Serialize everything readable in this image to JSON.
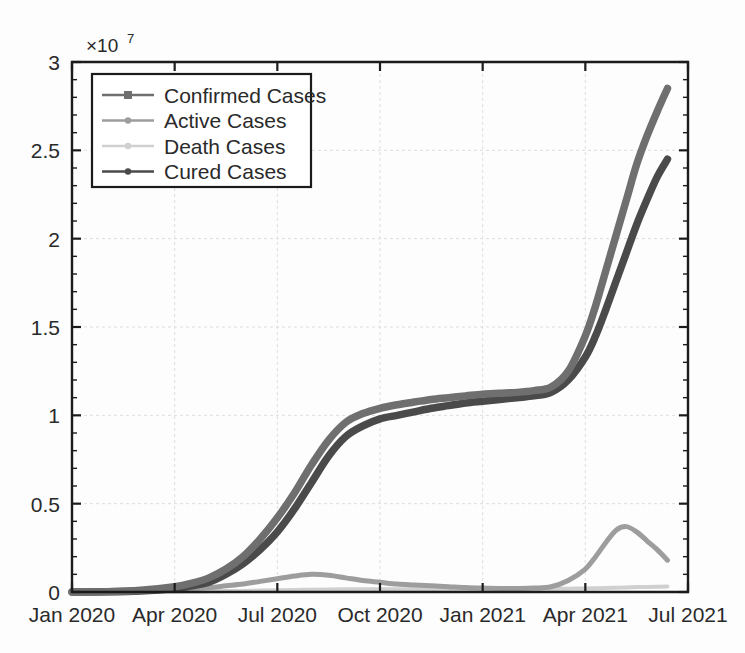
{
  "chart_data": {
    "type": "line",
    "title": "",
    "subtitle": "",
    "xlabel": "",
    "ylabel": "",
    "y_multiplier_label": "×10",
    "y_multiplier_exponent": "7",
    "y_multiplier_value": 10000000.0,
    "grid": true,
    "legend_position": "upper-left-inside",
    "xlim_labels": [
      "Jan 2020",
      "Jul 2021"
    ],
    "ylim": [
      0,
      3
    ],
    "yticks": [
      "0",
      "0.5",
      "1",
      "1.5",
      "2",
      "2.5",
      "3"
    ],
    "ytick_values": [
      0,
      0.5,
      1,
      1.5,
      2,
      2.5,
      3
    ],
    "xticks": [
      "Jan 2020",
      "Apr 2020",
      "Jul 2020",
      "Oct 2020",
      "Jan 2021",
      "Apr 2021",
      "Jul 2021"
    ],
    "xtick_values": [
      0,
      3,
      6,
      9,
      12,
      15,
      18
    ],
    "x_unit": "months since Jan 2020",
    "x": [
      0,
      1,
      2,
      3,
      3.5,
      4,
      4.5,
      5,
      5.5,
      6,
      6.5,
      7,
      7.5,
      8,
      8.5,
      9,
      9.5,
      10,
      10.5,
      11,
      11.5,
      12,
      12.5,
      13,
      13.5,
      14,
      14.5,
      15,
      15.3,
      15.6,
      15.9,
      16.2,
      16.5,
      16.8,
      17.1,
      17.4
    ],
    "series": [
      {
        "name": "Confirmed Cases",
        "color": "#6f6f6f",
        "marker": "square",
        "values": [
          0.0,
          0.002,
          0.01,
          0.03,
          0.05,
          0.08,
          0.13,
          0.2,
          0.3,
          0.42,
          0.56,
          0.72,
          0.86,
          0.96,
          1.01,
          1.04,
          1.06,
          1.075,
          1.09,
          1.1,
          1.11,
          1.12,
          1.125,
          1.13,
          1.14,
          1.16,
          1.25,
          1.45,
          1.62,
          1.82,
          2.02,
          2.22,
          2.42,
          2.58,
          2.72,
          2.85
        ]
      },
      {
        "name": "Active Cases",
        "color": "#9d9d9d",
        "marker": "dot",
        "values": [
          0.0,
          0.001,
          0.005,
          0.012,
          0.018,
          0.025,
          0.035,
          0.045,
          0.06,
          0.075,
          0.09,
          0.1,
          0.095,
          0.08,
          0.065,
          0.055,
          0.045,
          0.04,
          0.035,
          0.03,
          0.025,
          0.022,
          0.02,
          0.02,
          0.022,
          0.03,
          0.065,
          0.13,
          0.2,
          0.28,
          0.35,
          0.37,
          0.34,
          0.29,
          0.24,
          0.18
        ]
      },
      {
        "name": "Death Cases",
        "color": "#d0d0d0",
        "marker": "dot",
        "values": [
          0.0,
          0.0,
          0.001,
          0.002,
          0.003,
          0.004,
          0.005,
          0.006,
          0.008,
          0.01,
          0.012,
          0.013,
          0.014,
          0.015,
          0.015,
          0.016,
          0.016,
          0.016,
          0.017,
          0.017,
          0.017,
          0.017,
          0.017,
          0.018,
          0.018,
          0.018,
          0.019,
          0.02,
          0.021,
          0.022,
          0.024,
          0.026,
          0.028,
          0.029,
          0.03,
          0.031
        ]
      },
      {
        "name": "Cured Cases",
        "color": "#4a4a4a",
        "marker": "dot",
        "values": [
          0.0,
          0.001,
          0.006,
          0.02,
          0.035,
          0.055,
          0.1,
          0.16,
          0.24,
          0.34,
          0.47,
          0.62,
          0.77,
          0.88,
          0.94,
          0.98,
          1.0,
          1.02,
          1.04,
          1.055,
          1.07,
          1.08,
          1.09,
          1.1,
          1.11,
          1.13,
          1.2,
          1.33,
          1.45,
          1.6,
          1.76,
          1.92,
          2.08,
          2.22,
          2.35,
          2.45
        ]
      }
    ]
  },
  "legend": {
    "entries": [
      {
        "label": "Confirmed Cases"
      },
      {
        "label": "Active Cases"
      },
      {
        "label": "Death Cases"
      },
      {
        "label": "Cured Cases"
      }
    ]
  },
  "axes": {
    "y_exponent_prefix": "×10",
    "y_exponent_power": "7"
  }
}
